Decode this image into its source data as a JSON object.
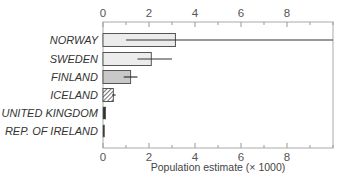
{
  "chart_data": {
    "type": "bar",
    "orientation": "horizontal",
    "title": "",
    "xlabel": "Population estimate (× 1000)",
    "ylabel": "",
    "xlim": [
      0,
      10
    ],
    "xticks": [
      0,
      2,
      4,
      6,
      8
    ],
    "grid": false,
    "categories": [
      "NORWAY",
      "SWEDEN",
      "FINLAND",
      "ICELAND",
      "UNITED KINGDOM",
      "REP. OF IRELAND"
    ],
    "values": [
      3.15,
      2.1,
      1.2,
      0.45,
      0.12,
      0.05
    ],
    "error_low": [
      1.0,
      1.5,
      0.9,
      0.4,
      null,
      null
    ],
    "error_high": [
      10.0,
      3.0,
      1.5,
      0.55,
      null,
      null
    ],
    "bar_styles": [
      "light",
      "light",
      "medium",
      "hatched",
      "dark",
      "dark"
    ],
    "colors": {
      "light": "#ececec",
      "medium": "#c8c8c8",
      "dark": "#333333",
      "frame": "#999999"
    }
  }
}
